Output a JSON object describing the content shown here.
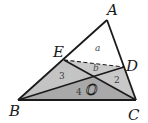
{
  "diagram": {
    "title": "",
    "points": {
      "A": {
        "label": "A",
        "x": 107,
        "y": 20
      },
      "B": {
        "label": "B",
        "x": 18,
        "y": 100
      },
      "C": {
        "label": "C",
        "x": 136,
        "y": 100
      },
      "D": {
        "label": "D",
        "x": 124,
        "y": 67
      },
      "E": {
        "label": "E",
        "x": 64,
        "y": 60
      },
      "O": {
        "label": "O",
        "x": 93,
        "y": 77
      }
    },
    "segments": [
      {
        "from": "A",
        "to": "B",
        "style": "solid"
      },
      {
        "from": "A",
        "to": "C",
        "style": "solid"
      },
      {
        "from": "B",
        "to": "C",
        "style": "solid"
      },
      {
        "from": "B",
        "to": "D",
        "style": "solid"
      },
      {
        "from": "C",
        "to": "E",
        "style": "solid"
      },
      {
        "from": "E",
        "to": "D",
        "style": "dashed"
      }
    ],
    "regions": [
      {
        "name": "AED",
        "label": "a",
        "fill": "#ffffff"
      },
      {
        "name": "EOD",
        "label": "b",
        "fill": "#c9c9c9"
      },
      {
        "name": "BEO",
        "label": "3",
        "fill": "#c4c4c4"
      },
      {
        "name": "DOC",
        "label": "2",
        "fill": "#c9c9c9"
      },
      {
        "name": "BOC",
        "label": "4",
        "fill": "#a9a9a9"
      }
    ],
    "labels": {
      "A": "A",
      "B": "B",
      "C": "C",
      "D": "D",
      "E": "E",
      "O": "O",
      "a": "a",
      "b": "b",
      "r3": "3",
      "r2": "2",
      "r4": "4"
    },
    "colors": {
      "stroke": "#1a1a1a",
      "light_fill": "#c6c6c6",
      "dark_fill": "#a9a9a9",
      "background": "#ffffff"
    }
  }
}
